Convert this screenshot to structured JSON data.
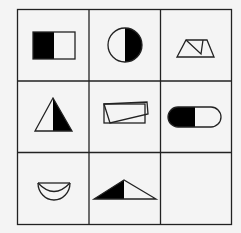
{
  "puzzle": {
    "type": "3x3 figure reasoning matrix",
    "rows": 3,
    "cols": 3,
    "colors": {
      "background": "#f4f4f4",
      "line": "#222222",
      "fill": "#000000",
      "empty": "#ffffff"
    },
    "cells": [
      {
        "row": 0,
        "col": 0,
        "shape": "rectangle-left-half-filled"
      },
      {
        "row": 0,
        "col": 1,
        "shape": "circle-right-half-filled"
      },
      {
        "row": 0,
        "col": 2,
        "shape": "trapezoid-with-inner-triangle-outline"
      },
      {
        "row": 1,
        "col": 0,
        "shape": "triangle-right-half-filled"
      },
      {
        "row": 1,
        "col": 1,
        "shape": "overlapping-parallelograms-outline"
      },
      {
        "row": 1,
        "col": 2,
        "shape": "capsule-left-half-filled"
      },
      {
        "row": 2,
        "col": 0,
        "shape": "crescent-bowl-outline"
      },
      {
        "row": 2,
        "col": 1,
        "shape": "obtuse-triangle-left-part-filled"
      },
      {
        "row": 2,
        "col": 2,
        "shape": "empty"
      }
    ]
  }
}
